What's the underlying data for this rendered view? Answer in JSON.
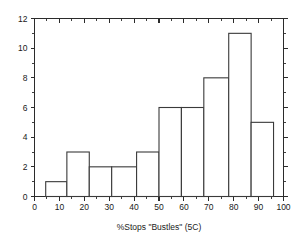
{
  "chart_data": {
    "type": "bar",
    "title": "",
    "subtitle": "",
    "xlabel": "%Stops \"Bustles\" (5C)",
    "ylabel": "",
    "xlim": [
      0,
      100
    ],
    "ylim": [
      0,
      12
    ],
    "grid": false,
    "legend": null,
    "bar_style": "unfilled-outline",
    "bin_edges": [
      4.5,
      13,
      22,
      31,
      41,
      50,
      59,
      68,
      78,
      87,
      96
    ],
    "categories": [
      "4.5-13",
      "13-22",
      "22-31",
      "31-41",
      "41-50",
      "50-59",
      "59-68",
      "68-78",
      "78-87",
      "87-96"
    ],
    "values": [
      1,
      3,
      2,
      2,
      3,
      6,
      6,
      8,
      11,
      5
    ],
    "x_ticks": [
      0,
      10,
      20,
      30,
      40,
      50,
      60,
      70,
      80,
      90,
      100
    ],
    "x_tick_labels": [
      "0",
      "10",
      "20",
      "30",
      "40",
      "50",
      "60",
      "70",
      "80",
      "90",
      "100"
    ],
    "x_minor_step": 5,
    "y_ticks": [
      0,
      2,
      4,
      6,
      8,
      10,
      12
    ],
    "y_tick_labels": [
      "0",
      "2",
      "4",
      "6",
      "8",
      "10",
      "12"
    ],
    "y_minor_step": 1,
    "colors": {
      "background": "#ffffff",
      "axis": "#2b2b2b",
      "bar_stroke": "#3a3a3a",
      "bar_fill": "#ffffff",
      "text": "#1a1a1a"
    }
  },
  "axes": {
    "x_axis_name": "x-axis",
    "y_axis_name": "y-axis",
    "top_axis_name": "top-axis",
    "right_axis_name": "right-axis"
  }
}
